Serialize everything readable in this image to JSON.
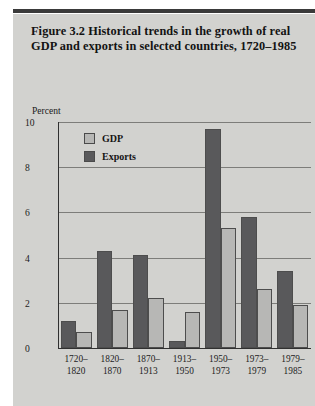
{
  "figure": {
    "title": "Figure 3.2  Historical trends in the growth of real GDP and exports in selected countries, 1720–1985",
    "panel_color": "#d2d2cf",
    "rule_color": "#3a3a3a"
  },
  "legend": {
    "position": "inside-top-left",
    "items": [
      {
        "label": "GDP",
        "color": "#b7b7b5"
      },
      {
        "label": "Exports",
        "color": "#59595b"
      }
    ]
  },
  "chart_data": {
    "type": "bar",
    "title": "Figure 3.2  Historical trends in the growth of real GDP and exports in selected countries, 1720–1985",
    "xlabel": "",
    "ylabel": "Percent",
    "ylim": [
      0,
      10
    ],
    "yticks": [
      0,
      2,
      4,
      6,
      8,
      10
    ],
    "ytick_labels": [
      "0",
      "2",
      "4",
      "6",
      "8",
      "10"
    ],
    "grid": true,
    "grid_axis": "y",
    "legend": [
      "GDP",
      "Exports"
    ],
    "categories": [
      "1720–\n1820",
      "1820–\n1870",
      "1870–\n1913",
      "1913–\n1950",
      "1950–\n1973",
      "1973–\n1979",
      "1979–\n1985"
    ],
    "category_lines": [
      [
        "1720–",
        "1820"
      ],
      [
        "1820–",
        "1870"
      ],
      [
        "1870–",
        "1913"
      ],
      [
        "1913–",
        "1950"
      ],
      [
        "1950–",
        "1973"
      ],
      [
        "1973–",
        "1979"
      ],
      [
        "1979–",
        "1985"
      ]
    ],
    "series": [
      {
        "name": "Exports",
        "color": "#59595b",
        "values": [
          1.2,
          4.3,
          4.1,
          0.3,
          9.7,
          5.8,
          3.4
        ]
      },
      {
        "name": "GDP",
        "color": "#b7b7b5",
        "values": [
          0.7,
          1.7,
          2.2,
          1.6,
          5.3,
          2.6,
          1.9
        ]
      }
    ]
  }
}
